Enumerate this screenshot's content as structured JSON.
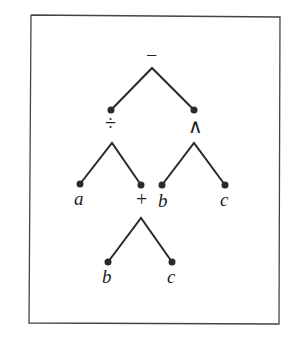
{
  "diagram": {
    "type": "expression-tree",
    "root": {
      "label": "−",
      "children": [
        {
          "label": "÷",
          "children": [
            {
              "label": "a"
            },
            {
              "label": "+",
              "children": [
                {
                  "label": "b"
                },
                {
                  "label": "c"
                }
              ]
            }
          ]
        },
        {
          "label": "∧",
          "children": [
            {
              "label": "b"
            },
            {
              "label": "c"
            }
          ]
        }
      ]
    },
    "labels": {
      "root": "−",
      "div": "÷",
      "pow": "∧",
      "a": "a",
      "plus": "+",
      "b1": "b",
      "c1": "c",
      "b2": "b",
      "c2": "c"
    },
    "colors": {
      "line": "#2a2a2a",
      "border": "#444444"
    }
  }
}
